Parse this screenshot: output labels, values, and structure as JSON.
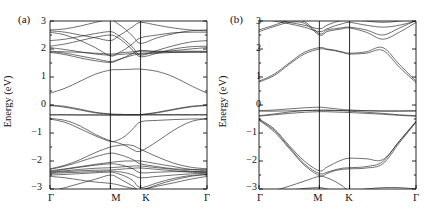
{
  "figure": {
    "type": "two-panel-band-structure",
    "background": "#ffffff",
    "line_color": "#222222",
    "axis_color": "#111111"
  },
  "panels": [
    {
      "id": "a",
      "label": "(a)",
      "ylabel": "Energy (eV)",
      "ylim": [
        -3,
        3
      ],
      "yticks": [
        -3,
        -2,
        -1,
        0,
        1,
        2,
        3
      ],
      "ytick_labels": [
        "−3",
        "−2",
        "−1",
        "0",
        "1",
        "2",
        "3"
      ],
      "yminor_ticks": [
        -2.5,
        -1.5,
        -0.5,
        0.5,
        1.5,
        2.5
      ],
      "xtick_labels": [
        "Γ",
        "M",
        "K",
        "Γ"
      ],
      "xtick_positions": [
        0,
        0.5,
        0.75,
        1.3
      ],
      "grid": false,
      "legend": "none"
    },
    {
      "id": "b",
      "label": "(b)",
      "ylabel": "Energy (eV)",
      "ylim": [
        -3,
        3
      ],
      "yticks": [
        -3,
        -2,
        -1,
        0,
        1,
        2,
        3
      ],
      "ytick_labels": [
        "−3",
        "−2",
        "−1",
        "0",
        "1",
        "2",
        "3"
      ],
      "yminor_ticks": [
        -2.5,
        -1.5,
        -0.5,
        0.5,
        1.5,
        2.5
      ],
      "xtick_labels": [
        "Γ",
        "M",
        "K",
        "Γ"
      ],
      "xtick_positions": [
        0,
        0.5,
        0.75,
        1.3
      ],
      "grid": false,
      "legend": "none"
    }
  ],
  "chart_data": [
    {
      "type": "line",
      "panel": "a",
      "title": "(a)",
      "xlabel": "",
      "ylabel": "Energy (eV)",
      "ylim": [
        -3,
        3
      ],
      "xlim": [
        0,
        1.3
      ],
      "x_high_symmetry_points": [
        {
          "label": "Γ",
          "x": 0
        },
        {
          "label": "M",
          "x": 0.5
        },
        {
          "label": "K",
          "x": 0.75
        },
        {
          "label": "Γ",
          "x": 1.3
        }
      ],
      "x": [
        0,
        0.125,
        0.25,
        0.375,
        0.5,
        0.5625,
        0.625,
        0.6875,
        0.75,
        0.8875,
        1.025,
        1.1625,
        1.3
      ],
      "series": [
        {
          "name": "band-01",
          "values": [
            -3.1,
            -2.95,
            -2.8,
            -2.65,
            -2.5,
            -2.6,
            -2.75,
            -2.9,
            -3.05,
            -2.85,
            -2.68,
            -2.55,
            -2.48
          ]
        },
        {
          "name": "band-02",
          "values": [
            -2.55,
            -2.6,
            -2.68,
            -2.75,
            -2.8,
            -2.85,
            -2.92,
            -2.98,
            -3.02,
            -2.9,
            -2.78,
            -2.65,
            -2.55
          ]
        },
        {
          "name": "band-03",
          "values": [
            -2.5,
            -2.48,
            -2.45,
            -2.42,
            -2.4,
            -2.45,
            -2.55,
            -2.7,
            -2.95,
            -2.78,
            -2.62,
            -2.52,
            -2.48
          ]
        },
        {
          "name": "band-04",
          "values": [
            -2.45,
            -2.42,
            -2.4,
            -2.38,
            -2.36,
            -2.38,
            -2.42,
            -2.5,
            -2.6,
            -2.55,
            -2.5,
            -2.46,
            -2.44
          ]
        },
        {
          "name": "band-05",
          "values": [
            -2.42,
            -2.38,
            -2.35,
            -2.33,
            -2.32,
            -2.3,
            -2.28,
            -2.26,
            -2.25,
            -2.3,
            -2.35,
            -2.4,
            -2.42
          ]
        },
        {
          "name": "band-06",
          "values": [
            -2.4,
            -2.35,
            -2.3,
            -2.26,
            -2.24,
            -2.22,
            -2.2,
            -2.18,
            -2.18,
            -2.24,
            -2.3,
            -2.36,
            -2.4
          ]
        },
        {
          "name": "band-07",
          "values": [
            -2.38,
            -2.3,
            -2.22,
            -2.15,
            -2.1,
            -2.12,
            -2.18,
            -2.28,
            -2.42,
            -2.4,
            -2.38,
            -2.38,
            -2.38
          ]
        },
        {
          "name": "band-08",
          "values": [
            -2.35,
            -2.28,
            -2.2,
            -2.12,
            -2.05,
            -2.02,
            -2.0,
            -2.0,
            -2.0,
            -2.1,
            -2.2,
            -2.3,
            -2.35
          ]
        },
        {
          "name": "band-09",
          "values": [
            -2.3,
            -2.18,
            -2.02,
            -1.85,
            -1.72,
            -1.76,
            -1.84,
            -1.95,
            -2.1,
            -2.2,
            -2.28,
            -2.3,
            -2.3
          ]
        },
        {
          "name": "band-10",
          "values": [
            -2.28,
            -2.15,
            -1.95,
            -1.7,
            -1.5,
            -1.45,
            -1.42,
            -1.45,
            -1.58,
            -1.85,
            -2.08,
            -2.22,
            -2.28
          ]
        },
        {
          "name": "band-11",
          "values": [
            -0.5,
            -0.62,
            -0.85,
            -1.1,
            -1.3,
            -1.25,
            -1.1,
            -0.85,
            -0.6,
            -0.55,
            -0.52,
            -0.5,
            -0.5
          ]
        },
        {
          "name": "band-12",
          "values": [
            -0.48,
            -0.55,
            -0.75,
            -1.05,
            -1.28,
            -1.35,
            -1.45,
            -1.6,
            -1.65,
            -1.3,
            -0.9,
            -0.6,
            -0.48
          ]
        },
        {
          "name": "band-13",
          "values": [
            -0.36,
            -0.36,
            -0.36,
            -0.36,
            -0.36,
            -0.36,
            -0.36,
            -0.36,
            -0.36,
            -0.36,
            -0.36,
            -0.36,
            -0.36
          ]
        },
        {
          "name": "band-14",
          "values": [
            -0.34,
            -0.34,
            -0.35,
            -0.35,
            -0.36,
            -0.36,
            -0.35,
            -0.35,
            -0.34,
            -0.34,
            -0.34,
            -0.34,
            -0.34
          ]
        },
        {
          "name": "band-15",
          "values": [
            -0.02,
            -0.08,
            -0.18,
            -0.28,
            -0.33,
            -0.34,
            -0.35,
            -0.35,
            -0.35,
            -0.28,
            -0.17,
            -0.07,
            -0.02
          ]
        },
        {
          "name": "band-16",
          "values": [
            0.0,
            -0.05,
            -0.15,
            -0.26,
            -0.32,
            -0.33,
            -0.34,
            -0.34,
            -0.34,
            -0.26,
            -0.15,
            -0.05,
            0.0
          ]
        },
        {
          "name": "band-17",
          "values": [
            0.42,
            0.6,
            0.85,
            1.1,
            1.25,
            1.26,
            1.27,
            1.28,
            1.28,
            1.2,
            1.0,
            0.7,
            0.42
          ]
        },
        {
          "name": "band-18",
          "values": [
            1.88,
            1.8,
            1.68,
            1.58,
            1.52,
            1.6,
            1.72,
            1.85,
            1.95,
            1.9,
            1.88,
            1.88,
            1.88
          ]
        },
        {
          "name": "band-19",
          "values": [
            1.9,
            1.85,
            1.75,
            1.65,
            1.55,
            1.62,
            1.7,
            1.78,
            1.82,
            1.85,
            1.88,
            1.9,
            1.9
          ]
        },
        {
          "name": "band-20",
          "values": [
            1.92,
            1.9,
            1.88,
            1.85,
            1.82,
            1.85,
            1.88,
            1.9,
            1.92,
            1.92,
            1.92,
            1.92,
            1.92
          ]
        },
        {
          "name": "band-21",
          "values": [
            2.05,
            1.98,
            1.9,
            1.82,
            1.78,
            1.8,
            1.82,
            1.84,
            1.85,
            1.88,
            1.94,
            2.0,
            2.05
          ]
        },
        {
          "name": "band-22",
          "values": [
            2.1,
            2.18,
            2.3,
            2.42,
            2.5,
            2.4,
            2.2,
            1.95,
            1.72,
            1.85,
            2.0,
            2.08,
            2.1
          ]
        },
        {
          "name": "band-23",
          "values": [
            2.3,
            2.35,
            2.45,
            2.55,
            2.62,
            2.5,
            2.3,
            2.05,
            1.78,
            1.95,
            2.12,
            2.25,
            2.3
          ]
        },
        {
          "name": "band-24",
          "values": [
            2.6,
            2.5,
            2.3,
            2.05,
            1.75,
            1.85,
            2.0,
            2.2,
            2.4,
            2.5,
            2.58,
            2.6,
            2.6
          ]
        },
        {
          "name": "band-25",
          "values": [
            2.65,
            2.6,
            2.5,
            2.4,
            2.3,
            2.45,
            2.62,
            2.8,
            2.95,
            2.85,
            2.75,
            2.68,
            2.65
          ]
        },
        {
          "name": "band-26",
          "values": [
            2.68,
            2.72,
            2.82,
            2.95,
            3.05,
            2.9,
            2.7,
            2.45,
            2.2,
            2.4,
            2.55,
            2.65,
            2.68
          ]
        }
      ]
    },
    {
      "type": "line",
      "panel": "b",
      "title": "(b)",
      "xlabel": "",
      "ylabel": "Energy (eV)",
      "ylim": [
        -3,
        3
      ],
      "xlim": [
        0,
        1.3
      ],
      "x_high_symmetry_points": [
        {
          "label": "Γ",
          "x": 0
        },
        {
          "label": "M",
          "x": 0.5
        },
        {
          "label": "K",
          "x": 0.75
        },
        {
          "label": "Γ",
          "x": 1.3
        }
      ],
      "x": [
        0,
        0.125,
        0.25,
        0.375,
        0.5,
        0.5625,
        0.625,
        0.6875,
        0.75,
        0.8875,
        1.025,
        1.1625,
        1.3
      ],
      "series": [
        {
          "name": "band-01",
          "values": [
            -3.25,
            -3.15,
            -3.05,
            -2.98,
            -2.95,
            -3.0,
            -3.08,
            -3.18,
            -3.28,
            -3.2,
            -3.1,
            -3.05,
            -3.05
          ]
        },
        {
          "name": "band-02",
          "values": [
            -3.15,
            -3.05,
            -2.9,
            -2.72,
            -2.55,
            -2.6,
            -2.72,
            -2.88,
            -3.05,
            -3.0,
            -2.95,
            -2.95,
            -3.0
          ]
        },
        {
          "name": "band-03",
          "values": [
            -0.55,
            -0.95,
            -1.55,
            -2.15,
            -2.52,
            -2.45,
            -2.35,
            -2.3,
            -2.28,
            -2.25,
            -2.1,
            -1.35,
            -0.62
          ]
        },
        {
          "name": "band-04",
          "values": [
            -0.52,
            -0.9,
            -1.5,
            -2.1,
            -2.45,
            -2.4,
            -2.32,
            -2.26,
            -2.24,
            -2.2,
            -2.02,
            -1.28,
            -0.6
          ]
        },
        {
          "name": "band-05",
          "values": [
            -0.5,
            -0.85,
            -1.45,
            -2.0,
            -2.35,
            -2.22,
            -2.08,
            -1.96,
            -1.9,
            -1.92,
            -1.95,
            -1.3,
            -0.58
          ]
        },
        {
          "name": "band-06",
          "values": [
            -0.2,
            -0.18,
            -0.14,
            -0.1,
            -0.08,
            -0.1,
            -0.13,
            -0.16,
            -0.18,
            -0.2,
            -0.21,
            -0.21,
            -0.2
          ]
        },
        {
          "name": "band-07",
          "values": [
            -0.22,
            -0.22,
            -0.21,
            -0.2,
            -0.2,
            -0.2,
            -0.2,
            -0.2,
            -0.2,
            -0.21,
            -0.22,
            -0.22,
            -0.22
          ]
        },
        {
          "name": "band-08",
          "values": [
            -0.38,
            -0.32,
            -0.25,
            -0.2,
            -0.18,
            -0.18,
            -0.19,
            -0.2,
            -0.22,
            -0.26,
            -0.3,
            -0.35,
            -0.38
          ]
        },
        {
          "name": "band-09",
          "values": [
            -0.4,
            -0.35,
            -0.3,
            -0.26,
            -0.24,
            -0.24,
            -0.25,
            -0.26,
            -0.27,
            -0.3,
            -0.33,
            -0.37,
            -0.4
          ]
        },
        {
          "name": "band-10",
          "values": [
            0.82,
            1.05,
            1.45,
            1.82,
            2.0,
            1.98,
            1.94,
            1.88,
            1.82,
            1.85,
            1.95,
            1.35,
            0.8
          ]
        },
        {
          "name": "band-11",
          "values": [
            0.85,
            1.1,
            1.5,
            1.88,
            2.05,
            2.0,
            1.96,
            1.9,
            1.85,
            1.9,
            2.05,
            1.45,
            0.85
          ]
        },
        {
          "name": "band-12",
          "values": [
            2.62,
            2.8,
            2.95,
            2.92,
            2.5,
            2.62,
            2.68,
            2.72,
            2.75,
            2.6,
            2.35,
            2.6,
            2.95
          ]
        },
        {
          "name": "band-13",
          "values": [
            2.68,
            2.85,
            3.02,
            2.98,
            2.55,
            2.68,
            2.72,
            2.76,
            2.78,
            2.68,
            2.5,
            2.75,
            3.02
          ]
        },
        {
          "name": "band-14",
          "values": [
            3.1,
            3.0,
            2.9,
            2.78,
            2.62,
            2.72,
            2.82,
            2.9,
            2.95,
            2.85,
            2.78,
            2.85,
            3.0
          ]
        },
        {
          "name": "band-15",
          "values": [
            3.15,
            3.05,
            2.95,
            2.85,
            2.72,
            2.85,
            2.95,
            3.02,
            3.05,
            3.0,
            2.95,
            3.0,
            3.1
          ]
        }
      ]
    }
  ]
}
